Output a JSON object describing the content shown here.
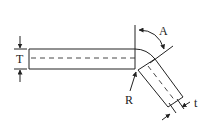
{
  "diagram": {
    "labels": {
      "thickness_straight": "T",
      "bend_angle": "A",
      "bend_radius": "R",
      "thickness_bent": "t"
    },
    "colors": {
      "line": "#222222",
      "background": "#ffffff"
    }
  }
}
